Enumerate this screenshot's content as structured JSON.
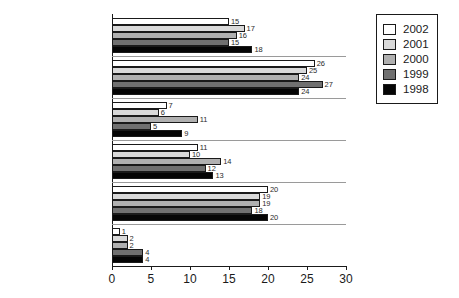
{
  "chart_data": {
    "type": "bar",
    "orientation": "horizontal",
    "title": "",
    "xlabel": "",
    "ylabel": "",
    "xlim": [
      0,
      30
    ],
    "xticks": [
      "0",
      "5",
      "10",
      "15",
      "20",
      "25",
      "30"
    ],
    "grid": false,
    "legend_position": "top-right",
    "categories": [
      "Exce. Producer",
      "Producer",
      "Director",
      "Writer",
      "Editor",
      "Cinematographer"
    ],
    "series": [
      {
        "name": "2002",
        "color": "#ffffff",
        "values": [
          15,
          26,
          7,
          11,
          20,
          1
        ]
      },
      {
        "name": "2001",
        "color": "#d9d9d9",
        "values": [
          17,
          25,
          6,
          10,
          19,
          2
        ]
      },
      {
        "name": "2000",
        "color": "#b0b0b0",
        "values": [
          16,
          24,
          11,
          14,
          19,
          2
        ]
      },
      {
        "name": "1999",
        "color": "#707070",
        "values": [
          15,
          27,
          5,
          12,
          18,
          4
        ]
      },
      {
        "name": "1998",
        "color": "#050505",
        "values": [
          18,
          24,
          9,
          13,
          20,
          4
        ]
      }
    ]
  }
}
